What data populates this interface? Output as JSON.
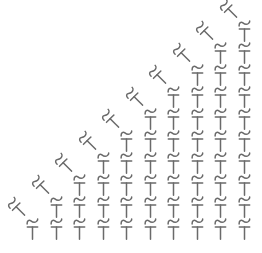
{
  "diagram": {
    "type": "crochet-stitch-chart",
    "background_color": "#ffffff",
    "symbol_color": "#6a6a6a",
    "columns": 10,
    "column_stitch_counts": [
      1,
      2,
      3,
      4,
      5,
      6,
      7,
      8,
      9,
      10
    ],
    "unit_symbols": {
      "top": "chain-tilde",
      "bottom": "half-double-crochet-T"
    },
    "diagonal_symbol": "chain-tilde-over-T-rotated",
    "layout": {
      "canvas_width": 262,
      "canvas_height": 253,
      "first_column_x": 32.5,
      "column_spacing": 23.5,
      "bottom_row_top_y": 218,
      "row_spacing": 22,
      "unit_width": 13,
      "unit_height": 22,
      "diagonal_offset_x": -15,
      "diagonal_offset_y": -10,
      "diagonal_rotation_deg": -45
    }
  }
}
